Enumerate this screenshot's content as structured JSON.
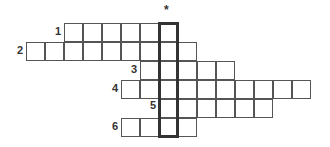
{
  "puzzle": {
    "marker": "*",
    "cell_size": 19,
    "origin_x": 26,
    "origin_y": 23,
    "highlight_col": 7,
    "rows": [
      {
        "number": "1",
        "start_col": 2,
        "length": 6
      },
      {
        "number": "2",
        "start_col": 0,
        "length": 9
      },
      {
        "number": "3",
        "start_col": 6,
        "length": 5
      },
      {
        "number": "4",
        "start_col": 5,
        "length": 10
      },
      {
        "number": "5",
        "start_col": 7,
        "length": 6
      },
      {
        "number": "6",
        "start_col": 5,
        "length": 4
      }
    ]
  }
}
